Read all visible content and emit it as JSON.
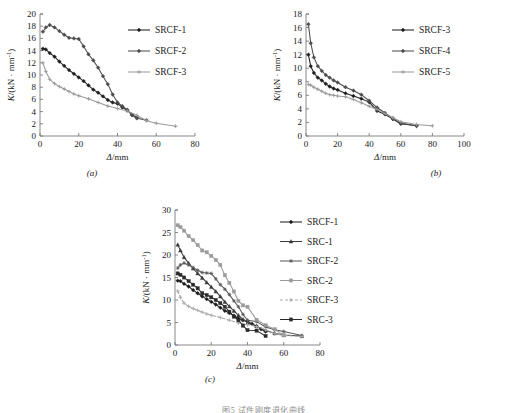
{
  "figure": {
    "caption": "图5  试件刚度退化曲线",
    "panels": [
      {
        "key": "a",
        "label": "(a)"
      },
      {
        "key": "b",
        "label": "(b)"
      },
      {
        "key": "c",
        "label": "(c)"
      }
    ]
  },
  "axis_labels": {
    "x": "Δ/mm",
    "y_prefix": "K",
    "y_rest": "/(kN · mm",
    "y_sup": "-1",
    "y_close": ")"
  },
  "colors": {
    "dark": "#1f1f1f",
    "mid": "#4d4d4d",
    "light": "#9a9a9a",
    "lighter": "#b0b0b0",
    "axis": "#7a7a7a"
  },
  "chart_data": [
    {
      "type": "line",
      "panel": "a",
      "title": "",
      "xlabel": "Δ/mm",
      "ylabel": "K/(kN · mm⁻¹)",
      "xlim": [
        0,
        80
      ],
      "ylim": [
        0,
        20
      ],
      "xticks": [
        0,
        20,
        40,
        60,
        80
      ],
      "yticks": [
        0,
        2,
        4,
        6,
        8,
        10,
        12,
        14,
        16,
        18,
        20
      ],
      "grid": false,
      "legend_position": "upper right",
      "series": [
        {
          "name": "SRCF-1",
          "color": "#1f1f1f",
          "marker": "diamond",
          "dash": false,
          "points": [
            [
              1.5,
              14.3
            ],
            [
              3,
              14.2
            ],
            [
              5,
              13.6
            ],
            [
              7.5,
              13.0
            ],
            [
              10,
              12.2
            ],
            [
              12.5,
              11.5
            ],
            [
              15,
              10.8
            ],
            [
              17.5,
              10.2
            ],
            [
              20,
              9.6
            ],
            [
              22.5,
              9.0
            ],
            [
              25,
              8.3
            ],
            [
              27.5,
              7.6
            ],
            [
              30,
              7.1
            ],
            [
              32.5,
              6.5
            ],
            [
              35,
              5.9
            ],
            [
              37.5,
              5.5
            ],
            [
              40,
              5.3
            ],
            [
              42.5,
              4.7
            ],
            [
              45,
              4.2
            ],
            [
              47.5,
              3.5
            ],
            [
              50,
              3.0
            ]
          ]
        },
        {
          "name": "SRCF-2",
          "color": "#4d4d4d",
          "marker": "diamond",
          "dash": false,
          "points": [
            [
              1.5,
              17.1
            ],
            [
              3,
              17.8
            ],
            [
              5,
              18.2
            ],
            [
              7.5,
              17.8
            ],
            [
              10,
              17.2
            ],
            [
              12.5,
              16.6
            ],
            [
              15,
              16.1
            ],
            [
              17.5,
              16.0
            ],
            [
              20,
              15.9
            ],
            [
              22.5,
              14.7
            ],
            [
              25,
              13.4
            ],
            [
              27.5,
              12.4
            ],
            [
              30,
              11.2
            ],
            [
              32.5,
              9.8
            ],
            [
              35,
              8.5
            ],
            [
              37.5,
              6.8
            ],
            [
              40,
              5.5
            ],
            [
              42.5,
              4.9
            ],
            [
              45,
              4.3
            ],
            [
              47.5,
              3.4
            ],
            [
              50,
              2.9
            ],
            [
              55,
              2.6
            ]
          ]
        },
        {
          "name": "SRCF-3",
          "color": "#9a9a9a",
          "marker": "plus",
          "dash": false,
          "points": [
            [
              1.5,
              12.0
            ],
            [
              3,
              10.6
            ],
            [
              5,
              9.3
            ],
            [
              7.5,
              8.6
            ],
            [
              10,
              8.1
            ],
            [
              12.5,
              7.7
            ],
            [
              15,
              7.3
            ],
            [
              17.5,
              6.9
            ],
            [
              20,
              6.6
            ],
            [
              25,
              6.1
            ],
            [
              30,
              5.5
            ],
            [
              35,
              4.9
            ],
            [
              40,
              4.5
            ],
            [
              45,
              4.1
            ],
            [
              50,
              3.4
            ],
            [
              55,
              2.5
            ],
            [
              60,
              2.1
            ],
            [
              70,
              1.6
            ]
          ]
        }
      ]
    },
    {
      "type": "line",
      "panel": "b",
      "title": "",
      "xlabel": "Δ/mm",
      "ylabel": "K/(kN · mm⁻¹)",
      "xlim": [
        0,
        100
      ],
      "ylim": [
        0,
        18
      ],
      "xticks": [
        0,
        20,
        40,
        60,
        80,
        100
      ],
      "yticks": [
        0,
        2,
        4,
        6,
        8,
        10,
        12,
        14,
        16,
        18
      ],
      "grid": false,
      "legend_position": "upper right",
      "series": [
        {
          "name": "SRCF-3",
          "color": "#1f1f1f",
          "marker": "diamond",
          "dash": false,
          "points": [
            [
              1.5,
              12.0
            ],
            [
              3,
              10.3
            ],
            [
              5,
              9.3
            ],
            [
              7.5,
              8.6
            ],
            [
              10,
              8.2
            ],
            [
              12.5,
              7.7
            ],
            [
              15,
              7.3
            ],
            [
              17.5,
              7.0
            ],
            [
              20,
              6.8
            ],
            [
              25,
              6.3
            ],
            [
              30,
              5.9
            ],
            [
              35,
              5.5
            ],
            [
              40,
              5.0
            ],
            [
              45,
              3.7
            ],
            [
              50,
              3.2
            ],
            [
              55,
              2.5
            ],
            [
              60,
              1.8
            ],
            [
              70,
              1.5
            ]
          ]
        },
        {
          "name": "SRCF-4",
          "color": "#4d4d4d",
          "marker": "diamond",
          "dash": false,
          "points": [
            [
              1.5,
              16.5
            ],
            [
              3,
              13.7
            ],
            [
              5,
              11.6
            ],
            [
              7.5,
              10.3
            ],
            [
              10,
              9.6
            ],
            [
              12.5,
              9.0
            ],
            [
              15,
              8.6
            ],
            [
              17.5,
              8.2
            ],
            [
              20,
              7.9
            ],
            [
              25,
              7.2
            ],
            [
              30,
              6.7
            ],
            [
              35,
              6.1
            ],
            [
              40,
              5.2
            ],
            [
              45,
              4.2
            ],
            [
              50,
              3.4
            ],
            [
              55,
              2.6
            ],
            [
              60,
              1.9
            ],
            [
              70,
              1.5
            ]
          ]
        },
        {
          "name": "SRCF-5",
          "color": "#9a9a9a",
          "marker": "plus",
          "dash": false,
          "points": [
            [
              1.5,
              7.6
            ],
            [
              3,
              7.5
            ],
            [
              5,
              7.2
            ],
            [
              7.5,
              6.9
            ],
            [
              10,
              6.6
            ],
            [
              12.5,
              6.3
            ],
            [
              15,
              6.1
            ],
            [
              17.5,
              6.0
            ],
            [
              20,
              5.9
            ],
            [
              25,
              5.8
            ],
            [
              30,
              5.4
            ],
            [
              35,
              4.9
            ],
            [
              40,
              4.4
            ],
            [
              45,
              3.9
            ],
            [
              50,
              3.3
            ],
            [
              55,
              2.7
            ],
            [
              60,
              2.1
            ],
            [
              70,
              1.7
            ],
            [
              80,
              1.5
            ]
          ]
        }
      ]
    },
    {
      "type": "line",
      "panel": "c",
      "title": "",
      "xlabel": "Δ/mm",
      "ylabel": "K/(kN · mm⁻¹)",
      "xlim": [
        0,
        80
      ],
      "ylim": [
        0,
        30
      ],
      "xticks": [
        0,
        20,
        40,
        60,
        80
      ],
      "yticks": [
        0,
        5,
        10,
        15,
        20,
        25,
        30
      ],
      "grid": false,
      "legend_position": "upper right",
      "series": [
        {
          "name": "SRCF-1",
          "color": "#1f1f1f",
          "marker": "diamond",
          "dash": false,
          "points": [
            [
              1.5,
              14.3
            ],
            [
              3,
              14.2
            ],
            [
              5,
              13.6
            ],
            [
              7.5,
              13.0
            ],
            [
              10,
              12.2
            ],
            [
              12.5,
              11.5
            ],
            [
              15,
              10.8
            ],
            [
              17.5,
              10.2
            ],
            [
              20,
              9.6
            ],
            [
              22.5,
              9.0
            ],
            [
              25,
              8.3
            ],
            [
              27.5,
              7.6
            ],
            [
              30,
              7.1
            ],
            [
              32.5,
              6.5
            ],
            [
              35,
              5.9
            ],
            [
              37.5,
              5.5
            ],
            [
              40,
              5.3
            ],
            [
              42.5,
              4.7
            ],
            [
              45,
              4.2
            ],
            [
              47.5,
              3.5
            ],
            [
              50,
              3.0
            ]
          ]
        },
        {
          "name": "SRC-1",
          "color": "#3a3a3a",
          "marker": "triangle",
          "dash": false,
          "points": [
            [
              1.5,
              22.3
            ],
            [
              3,
              21.0
            ],
            [
              5,
              19.5
            ],
            [
              7.5,
              18.2
            ],
            [
              10,
              17.0
            ],
            [
              12.5,
              15.9
            ],
            [
              15,
              14.9
            ],
            [
              17.5,
              13.9
            ],
            [
              20,
              12.9
            ],
            [
              22.5,
              11.9
            ],
            [
              25,
              10.8
            ],
            [
              27.5,
              9.6
            ],
            [
              30,
              8.6
            ],
            [
              32.5,
              7.6
            ],
            [
              35,
              6.6
            ],
            [
              37.5,
              5.7
            ],
            [
              40,
              4.9
            ],
            [
              45,
              4.2
            ],
            [
              50,
              3.2
            ],
            [
              55,
              2.6
            ],
            [
              60,
              2.2
            ],
            [
              70,
              2.0
            ]
          ]
        },
        {
          "name": "SRCF-2",
          "color": "#5a5a5a",
          "marker": "star",
          "dash": false,
          "points": [
            [
              1.5,
              17.1
            ],
            [
              3,
              17.8
            ],
            [
              5,
              18.2
            ],
            [
              7.5,
              17.8
            ],
            [
              10,
              17.2
            ],
            [
              12.5,
              16.6
            ],
            [
              15,
              16.1
            ],
            [
              17.5,
              16.0
            ],
            [
              20,
              15.9
            ],
            [
              22.5,
              14.7
            ],
            [
              25,
              13.4
            ],
            [
              27.5,
              12.4
            ],
            [
              30,
              11.2
            ],
            [
              32.5,
              9.8
            ],
            [
              35,
              8.5
            ],
            [
              37.5,
              6.8
            ],
            [
              40,
              5.5
            ],
            [
              45,
              5.2
            ],
            [
              50,
              4.0
            ],
            [
              55,
              3.4
            ],
            [
              60,
              3.0
            ],
            [
              70,
              2.1
            ]
          ]
        },
        {
          "name": "SRC-2",
          "color": "#9a9a9a",
          "marker": "square",
          "dash": false,
          "points": [
            [
              1.5,
              26.6
            ],
            [
              3,
              26.2
            ],
            [
              5,
              25.4
            ],
            [
              7.5,
              24.2
            ],
            [
              10,
              23.3
            ],
            [
              12.5,
              22.2
            ],
            [
              15,
              21.0
            ],
            [
              17.5,
              20.6
            ],
            [
              20,
              19.8
            ],
            [
              22.5,
              18.9
            ],
            [
              25,
              17.8
            ],
            [
              27.5,
              15.5
            ],
            [
              30,
              13.8
            ],
            [
              32.5,
              11.9
            ],
            [
              35,
              9.8
            ],
            [
              37.5,
              8.8
            ],
            [
              40,
              8.5
            ],
            [
              45,
              5.6
            ],
            [
              50,
              4.4
            ],
            [
              55,
              3.5
            ],
            [
              60,
              2.2
            ]
          ]
        },
        {
          "name": "SRCF-3",
          "color": "#a8a8a8",
          "marker": "plus",
          "dash": true,
          "points": [
            [
              1.5,
              12.0
            ],
            [
              3,
              10.6
            ],
            [
              5,
              9.3
            ],
            [
              7.5,
              8.6
            ],
            [
              10,
              8.1
            ],
            [
              12.5,
              7.7
            ],
            [
              15,
              7.3
            ],
            [
              17.5,
              6.9
            ],
            [
              20,
              6.6
            ],
            [
              25,
              6.1
            ],
            [
              30,
              5.5
            ],
            [
              35,
              4.9
            ],
            [
              40,
              4.5
            ],
            [
              45,
              4.1
            ],
            [
              50,
              3.4
            ],
            [
              55,
              2.5
            ],
            [
              60,
              2.1
            ],
            [
              70,
              1.9
            ]
          ]
        },
        {
          "name": "SRC-3",
          "color": "#2b2b2b",
          "marker": "square",
          "dash": false,
          "points": [
            [
              1.5,
              15.9
            ],
            [
              3,
              15.6
            ],
            [
              5,
              15.0
            ],
            [
              7.5,
              14.2
            ],
            [
              10,
              13.4
            ],
            [
              12.5,
              12.6
            ],
            [
              15,
              11.5
            ],
            [
              17.5,
              11.1
            ],
            [
              20,
              10.6
            ],
            [
              22.5,
              10.0
            ],
            [
              25,
              9.3
            ],
            [
              27.5,
              8.5
            ],
            [
              30,
              7.4
            ],
            [
              32.5,
              6.3
            ],
            [
              35,
              5.5
            ],
            [
              37.5,
              4.3
            ],
            [
              40,
              3.3
            ],
            [
              45,
              3.2
            ],
            [
              50,
              2.0
            ]
          ]
        }
      ]
    }
  ]
}
